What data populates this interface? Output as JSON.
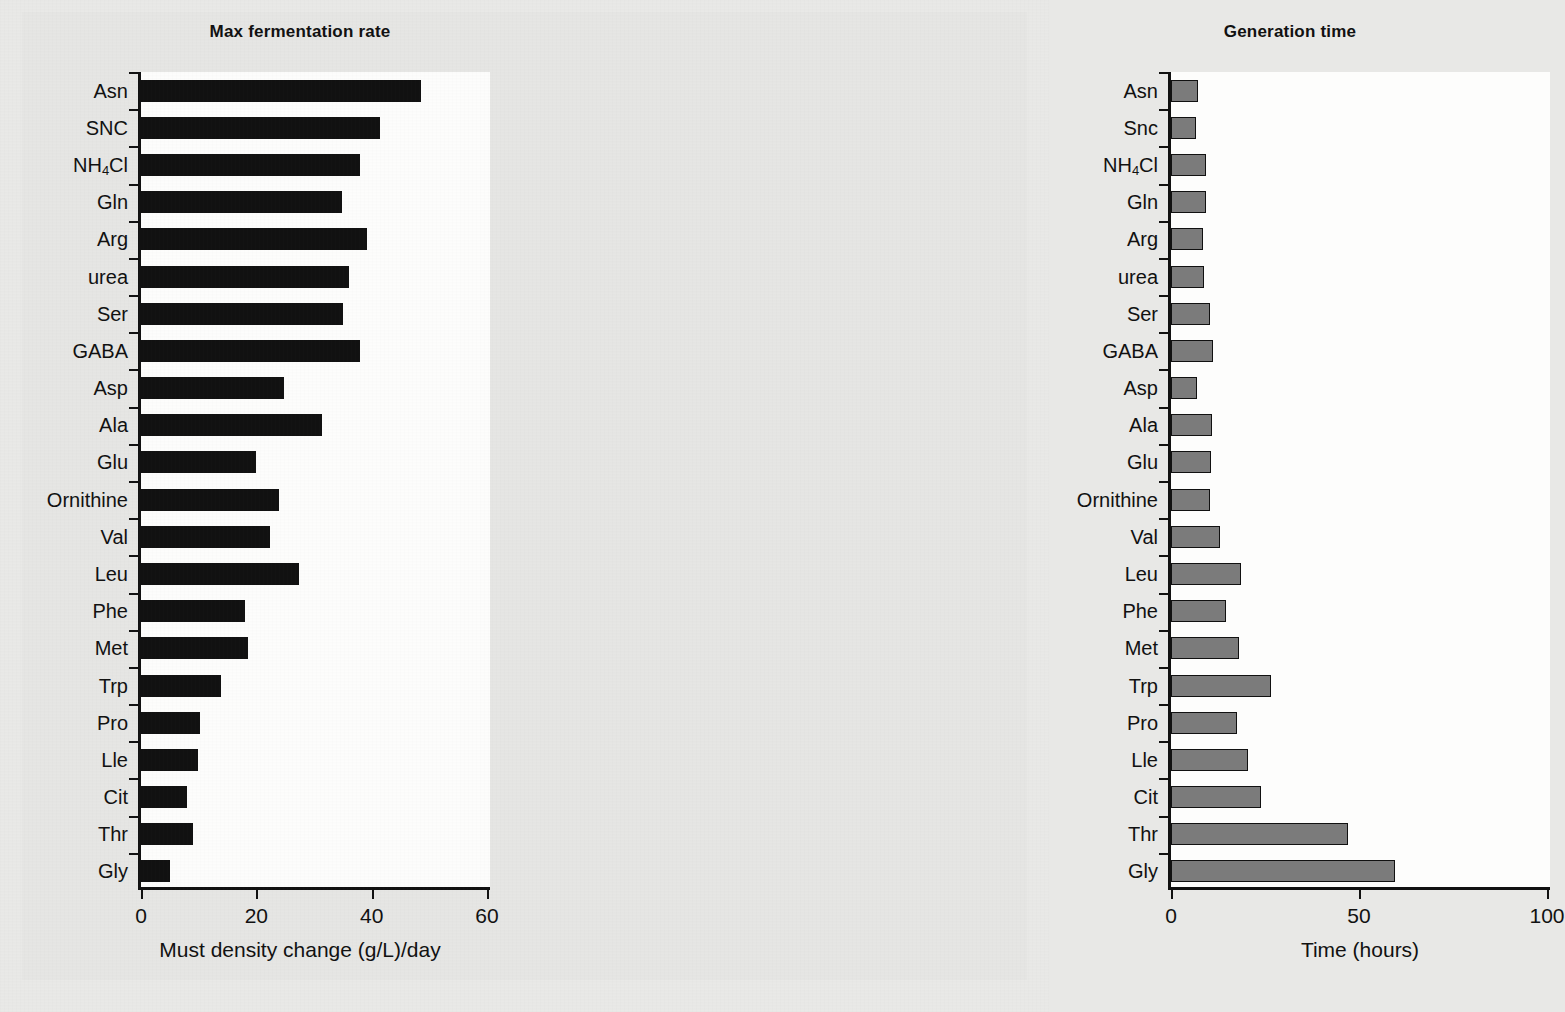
{
  "figure": {
    "background_color": "#e6e6e4",
    "panel_color": "#fdfdfc"
  },
  "chart_data": [
    {
      "type": "bar",
      "orientation": "horizontal",
      "id": "max-fermentation-rate",
      "title": "Max fermentation rate",
      "xlabel": "Must density change (g/L)/day",
      "ylabel": "",
      "xlim": [
        0,
        60
      ],
      "xticks": [
        0,
        20,
        40,
        60
      ],
      "xtick_labels": [
        "0",
        "20",
        "40",
        "60"
      ],
      "grid": false,
      "legend": "none",
      "bar_color": "#111111",
      "categories": [
        "Asn",
        "SNC",
        "NH4Cl",
        "Gln",
        "Arg",
        "urea",
        "Ser",
        "GABA",
        "Asp",
        "Ala",
        "Glu",
        "Ornithine",
        "Val",
        "Leu",
        "Phe",
        "Met",
        "Trp",
        "Pro",
        "Lle",
        "Cit",
        "Thr",
        "Gly"
      ],
      "category_labels_html": [
        "Asn",
        "SNC",
        "NH<sub>4</sub>Cl",
        "Gln",
        "Arg",
        "urea",
        "Ser",
        "GABA",
        "Asp",
        "Ala",
        "Glu",
        "Ornithine",
        "Val",
        "Leu",
        "Phe",
        "Met",
        "Trp",
        "Pro",
        "Lle",
        "Cit",
        "Thr",
        "Gly"
      ],
      "values": [
        48.5,
        41.5,
        38.0,
        34.8,
        39.2,
        36.0,
        35.0,
        38.0,
        24.8,
        31.4,
        20.0,
        24.0,
        22.4,
        27.4,
        18.0,
        18.6,
        13.8,
        10.2,
        9.8,
        8.0,
        9.0,
        5.0
      ]
    },
    {
      "type": "bar",
      "orientation": "horizontal",
      "id": "generation-time",
      "title": "Generation time",
      "xlabel": "Time (hours)",
      "ylabel": "",
      "xlim": [
        0,
        100
      ],
      "xticks": [
        0,
        50,
        100
      ],
      "xtick_labels": [
        "0",
        "50",
        "100"
      ],
      "grid": false,
      "legend": "none",
      "bar_color": "#7b7b7b",
      "bar_edge_color": "#111111",
      "categories": [
        "Asn",
        "Snc",
        "NH4Cl",
        "Gln",
        "Arg",
        "urea",
        "Ser",
        "GABA",
        "Asp",
        "Ala",
        "Glu",
        "Ornithine",
        "Val",
        "Leu",
        "Phe",
        "Met",
        "Trp",
        "Pro",
        "Lle",
        "Cit",
        "Thr",
        "Gly"
      ],
      "category_labels_html": [
        "Asn",
        "Snc",
        "NH<sub>4</sub>Cl",
        "Gln",
        "Arg",
        "urea",
        "Ser",
        "GABA",
        "Asp",
        "Ala",
        "Glu",
        "Ornithine",
        "Val",
        "Leu",
        "Phe",
        "Met",
        "Trp",
        "Pro",
        "Lle",
        "Cit",
        "Thr",
        "Gly"
      ],
      "values": [
        7.1,
        6.6,
        9.2,
        9.2,
        8.4,
        8.9,
        10.5,
        11.3,
        7.0,
        11.0,
        10.6,
        10.3,
        13.0,
        18.5,
        14.5,
        18.0,
        26.6,
        17.5,
        20.5,
        24.0,
        47.0,
        59.5
      ]
    }
  ]
}
